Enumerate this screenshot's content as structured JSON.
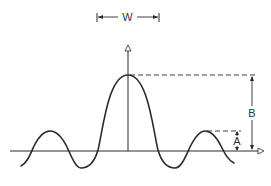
{
  "diagram": {
    "type": "sinc-like waveform with dimension annotations",
    "colors": {
      "stroke": "#2a2a2a",
      "background": "#ffffff"
    },
    "labels": {
      "width": "W",
      "main_peak_height": "B",
      "side_lobe_height": "A"
    },
    "elements": {
      "horizontal_axis": "baseline with open arrowhead at right",
      "vertical_axis": "center axis with open arrowhead at top",
      "waveform": "central main lobe with side lobes on both sides",
      "width_dimension": "W arrow between main lobe width markers",
      "B_dimension": "height of main peak above baseline",
      "A_dimension": "height of first side lobe above baseline"
    }
  }
}
